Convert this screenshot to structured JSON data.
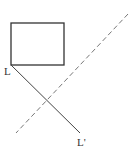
{
  "diagram": {
    "rectangle": {
      "x": 11,
      "y": 23,
      "width": 53,
      "height": 42,
      "stroke": "#333333"
    },
    "segment": {
      "x1": 11,
      "y1": 65,
      "x2": 80,
      "y2": 133,
      "stroke": "#444444"
    },
    "mirror_line": {
      "x1": 128,
      "y1": 14,
      "x2": 16,
      "y2": 133,
      "stroke": "#777777",
      "style": "dashed"
    },
    "labels": {
      "start": "L",
      "end": "L'"
    }
  }
}
